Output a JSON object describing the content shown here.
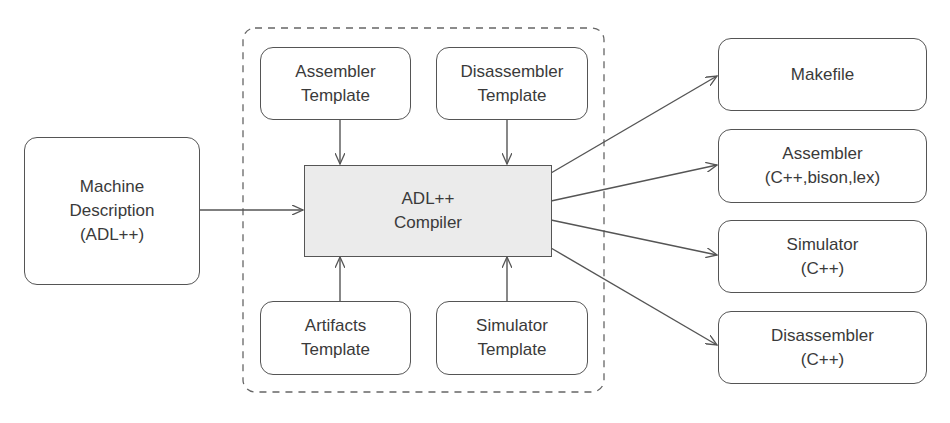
{
  "diagram": {
    "input": {
      "lines": [
        "Machine",
        "Description",
        "(ADL++)"
      ]
    },
    "compiler": {
      "lines": [
        "ADL++",
        "Compiler"
      ]
    },
    "templates": [
      {
        "id": "assembler-template",
        "lines": [
          "Assembler",
          "Template"
        ]
      },
      {
        "id": "disassembler-template",
        "lines": [
          "Disassembler",
          "Template"
        ]
      },
      {
        "id": "artifacts-template",
        "lines": [
          "Artifacts",
          "Template"
        ]
      },
      {
        "id": "simulator-template",
        "lines": [
          "Simulator",
          "Template"
        ]
      }
    ],
    "outputs": [
      {
        "id": "makefile",
        "lines": [
          "Makefile"
        ]
      },
      {
        "id": "assembler",
        "lines": [
          "Assembler",
          "(C++,bison,lex)"
        ]
      },
      {
        "id": "simulator",
        "lines": [
          "Simulator",
          "(C++)"
        ]
      },
      {
        "id": "disassembler",
        "lines": [
          "Disassembler",
          "(C++)"
        ]
      }
    ],
    "colors": {
      "stroke": "#555555",
      "compiler_fill": "#ebebeb",
      "text": "#3a3a3a"
    }
  }
}
